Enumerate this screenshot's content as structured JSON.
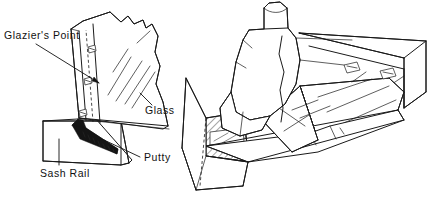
{
  "figure": {
    "medium": "line-art technical illustration",
    "background_color": "#ffffff",
    "ink_color": "#1a1a1a",
    "width": 436,
    "height": 201
  },
  "labels": {
    "glaziers_point": "Glazier's Point",
    "glass": "Glass",
    "putty": "Putty",
    "sash_rail": "Sash Rail"
  },
  "panels": {
    "left": {
      "name": "labeled-cutaway-view",
      "description": "Glass pane seated on sash rail with glazier's points and putty bead"
    },
    "right": {
      "name": "putty-application-view",
      "description": "Hand pressing putty along the glazed sash with glazier's points set in the rabbet"
    }
  },
  "icons": {
    "glaziers_point": "triangular-point-icon",
    "hatching": "cross-section-hatch-icon"
  }
}
